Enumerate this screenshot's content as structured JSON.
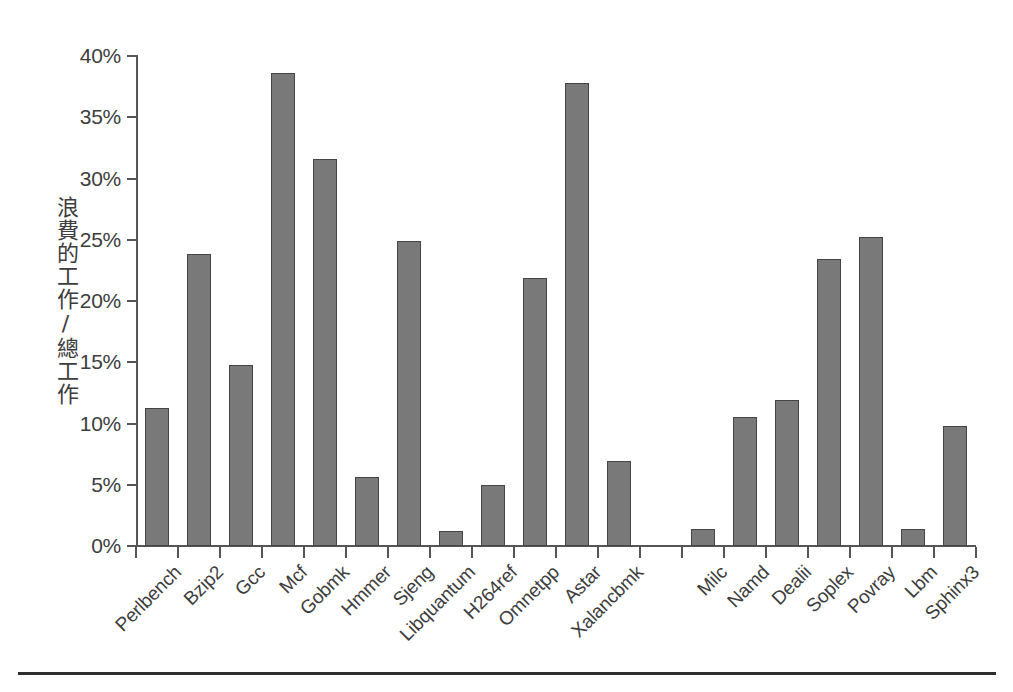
{
  "chart_data": {
    "type": "bar",
    "title": "",
    "subtitle": "",
    "xlabel": "",
    "ylabel": "浪費的工作/總工作",
    "ylim": [
      0,
      40
    ],
    "ytick_values": [
      0,
      5,
      10,
      15,
      20,
      25,
      30,
      35,
      40
    ],
    "ytick_labels": [
      "0%",
      "5%",
      "10%",
      "15%",
      "20%",
      "25%",
      "30%",
      "35%",
      "40%"
    ],
    "yunit": "%",
    "grid": false,
    "legend": false,
    "legend_position": "none",
    "bar_fill_color": "#797979",
    "bar_edge_color": "#454545",
    "axis_color": "#555555",
    "background_color": "#ffffff",
    "categories": [
      "Perlbench",
      "Bzip2",
      "Gcc",
      "Mcf",
      "Gobmk",
      "Hmmer",
      "Sjeng",
      "Libquantum",
      "H264ref",
      "Omnetpp",
      "Astar",
      "Xalancbmk",
      "",
      "Milc",
      "Namd",
      "Dealii",
      "Soplex",
      "Povray",
      "Lbm",
      "Sphinx3"
    ],
    "values": [
      11.3,
      23.8,
      14.8,
      38.6,
      31.6,
      5.6,
      24.9,
      1.2,
      5.0,
      21.9,
      37.8,
      6.9,
      null,
      1.4,
      10.5,
      11.9,
      23.4,
      25.2,
      1.4,
      9.8
    ]
  }
}
